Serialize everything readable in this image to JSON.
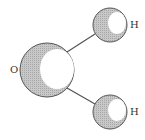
{
  "diagram": {
    "atoms": [
      {
        "id": "O",
        "label": "O",
        "cx": 47,
        "cy": 70,
        "r": 27
      },
      {
        "id": "H1",
        "label": "H",
        "cx": 110,
        "cy": 25,
        "r": 17
      },
      {
        "id": "H2",
        "label": "H",
        "cx": 110,
        "cy": 112,
        "r": 17
      }
    ],
    "bonds": [
      {
        "from": "O",
        "to": "H1"
      },
      {
        "from": "O",
        "to": "H2"
      }
    ],
    "colors": {
      "shade": "#bdbdbd",
      "outline": "#555555",
      "highlight": "#ffffff"
    }
  }
}
